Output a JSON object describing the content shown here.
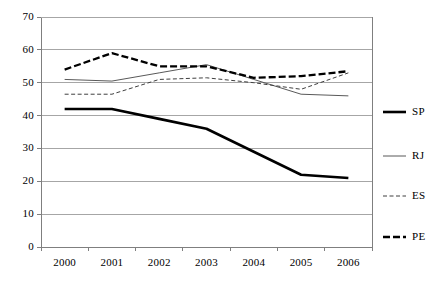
{
  "chart_data": {
    "type": "line",
    "title": "",
    "subtitle": "",
    "xlabel": "",
    "ylabel": "",
    "categories": [
      "2000",
      "2001",
      "2002",
      "2003",
      "2004",
      "2005",
      "2006"
    ],
    "ylim": [
      0,
      70
    ],
    "ytick_values": [
      "0",
      "10",
      "20",
      "30",
      "40",
      "50",
      "60",
      "70"
    ],
    "grid": "horizontal",
    "legend_position": "right",
    "series": [
      {
        "name": "SP",
        "values": [
          42,
          42,
          39,
          36,
          29,
          22,
          21
        ],
        "color": "#000000",
        "style": "solid",
        "width": 2.6
      },
      {
        "name": "RJ",
        "values": [
          51,
          50.5,
          53,
          55.5,
          51,
          46.5,
          46
        ],
        "color": "#595959",
        "style": "solid",
        "width": 1.0
      },
      {
        "name": "ES",
        "values": [
          46.5,
          46.5,
          51,
          51.5,
          50,
          48,
          53
        ],
        "color": "#3f3f3f",
        "style": "dashed-thin",
        "width": 1.0
      },
      {
        "name": "PE",
        "values": [
          54,
          59,
          55,
          55,
          51.5,
          52,
          53.5
        ],
        "color": "#000000",
        "style": "dashed-thick",
        "width": 2.3
      }
    ]
  },
  "legend": {
    "entries": [
      {
        "label": "SP"
      },
      {
        "label": "RJ"
      },
      {
        "label": "ES"
      },
      {
        "label": "PE"
      }
    ]
  },
  "axes": {
    "y_labels": [
      "70",
      "60",
      "50",
      "40",
      "30",
      "20",
      "10",
      "0"
    ],
    "x_labels": [
      "2000",
      "2001",
      "2002",
      "2003",
      "2004",
      "2005",
      "2006"
    ]
  },
  "colors": {
    "axis": "#7f7f7f",
    "gridline": "#a6a6a6",
    "background": "#ffffff",
    "text": "#000000"
  }
}
